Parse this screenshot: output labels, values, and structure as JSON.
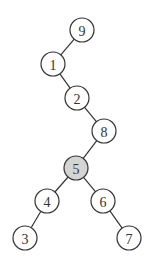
{
  "diagram": {
    "type": "binary-tree",
    "highlight_color": "#d4d4d4",
    "nodes": [
      {
        "id": "9",
        "label": "9",
        "x": 82,
        "y": 30,
        "highlight": false
      },
      {
        "id": "1",
        "label": "1",
        "x": 53,
        "y": 64,
        "highlight": false
      },
      {
        "id": "2",
        "label": "2",
        "x": 77,
        "y": 98,
        "highlight": false
      },
      {
        "id": "8",
        "label": "8",
        "x": 104,
        "y": 131,
        "highlight": false
      },
      {
        "id": "5",
        "label": "5",
        "x": 76,
        "y": 168,
        "highlight": true
      },
      {
        "id": "4",
        "label": "4",
        "x": 47,
        "y": 201,
        "highlight": false
      },
      {
        "id": "6",
        "label": "6",
        "x": 103,
        "y": 201,
        "highlight": false
      },
      {
        "id": "3",
        "label": "3",
        "x": 25,
        "y": 238,
        "highlight": false
      },
      {
        "id": "7",
        "label": "7",
        "x": 129,
        "y": 238,
        "highlight": false
      }
    ],
    "edges": [
      {
        "from": "9",
        "to": "1"
      },
      {
        "from": "1",
        "to": "2"
      },
      {
        "from": "2",
        "to": "8"
      },
      {
        "from": "8",
        "to": "5"
      },
      {
        "from": "5",
        "to": "4"
      },
      {
        "from": "5",
        "to": "6"
      },
      {
        "from": "4",
        "to": "3"
      },
      {
        "from": "6",
        "to": "7"
      }
    ]
  }
}
